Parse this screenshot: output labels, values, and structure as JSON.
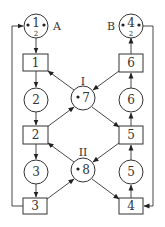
{
  "diagram": {
    "type": "petri-net",
    "places": [
      {
        "id": "p1",
        "label": "1",
        "sublabel": "2",
        "tokens": 2,
        "tag": "A"
      },
      {
        "id": "p2",
        "label": "2",
        "tokens": 0
      },
      {
        "id": "p3",
        "label": "3",
        "tokens": 0
      },
      {
        "id": "p4",
        "label": "4",
        "sublabel": "2",
        "tokens": 2,
        "tag": "B"
      },
      {
        "id": "p5",
        "label": "5",
        "tokens": 0
      },
      {
        "id": "p6",
        "label": "6",
        "tokens": 0
      },
      {
        "id": "p7",
        "label": "7",
        "tokens": 1,
        "tag": "I"
      },
      {
        "id": "p8",
        "label": "8",
        "tokens": 1,
        "tag": "II"
      }
    ],
    "transitions": [
      {
        "id": "t1",
        "label": "1"
      },
      {
        "id": "t2",
        "label": "2"
      },
      {
        "id": "t3",
        "label": "3"
      },
      {
        "id": "t4",
        "label": "4"
      },
      {
        "id": "t5",
        "label": "5"
      },
      {
        "id": "t6",
        "label": "6"
      }
    ],
    "arcs": [
      [
        "p1",
        "t1"
      ],
      [
        "t1",
        "p2"
      ],
      [
        "p2",
        "t2"
      ],
      [
        "t2",
        "p3"
      ],
      [
        "p3",
        "t3"
      ],
      [
        "t3",
        "p1"
      ],
      [
        "p4",
        "t4"
      ],
      [
        "t4",
        "p5"
      ],
      [
        "p5",
        "t5"
      ],
      [
        "t5",
        "p6"
      ],
      [
        "p6",
        "t6"
      ],
      [
        "t6",
        "p4"
      ],
      [
        "p7",
        "t1"
      ],
      [
        "t2",
        "p7"
      ],
      [
        "p7",
        "t5"
      ],
      [
        "t6",
        "p7"
      ],
      [
        "p8",
        "t2"
      ],
      [
        "t3",
        "p8"
      ],
      [
        "p8",
        "t4"
      ],
      [
        "t5",
        "p8"
      ]
    ]
  }
}
